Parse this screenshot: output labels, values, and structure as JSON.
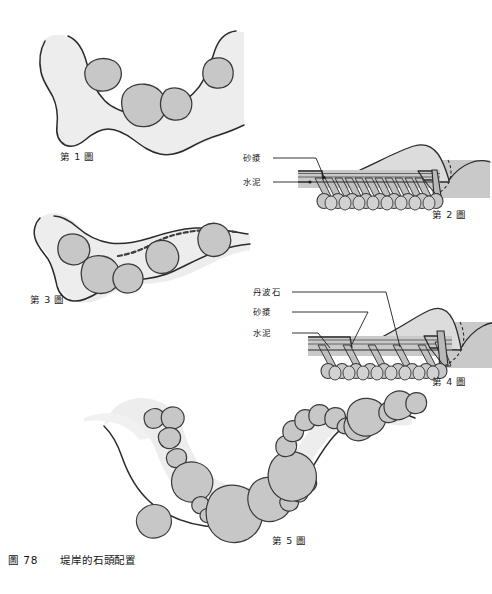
{
  "plate": {
    "caption_number": "圖 78",
    "caption_title": "堤岸的石頭配置",
    "background_color": "#ffffff",
    "ink_color": "#1d1d1d"
  },
  "palette": {
    "bank_fill": "#ededed",
    "bank_fill_light": "#f2f2f2",
    "stone_fill": "#c7c7c7",
    "stone_stroke": "#3a3a3a",
    "ground_fill": "#c9c9c9",
    "mound_fill": "#dcdcdc",
    "hatch_stroke": "#555555",
    "leader_stroke": "#1d1d1d"
  },
  "figures": [
    {
      "id": "fig1",
      "label": "第 1 圖",
      "type": "plan-view-bank",
      "description": "平面圖：堤岸曲線與岸邊配置的大小石頭",
      "stone_count": 4
    },
    {
      "id": "fig2",
      "label": "第 2 圖",
      "type": "cross-section",
      "description": "剖面圖：砂漿與水泥鋪設的堤岸斷面",
      "annotations": [
        {
          "key": "mortar",
          "label": "砂漿"
        },
        {
          "key": "cement",
          "label": "水泥"
        }
      ]
    },
    {
      "id": "fig3",
      "label": "第 3 圖",
      "type": "plan-view-bank",
      "description": "平面圖：較淺的堤岸與沿岸石頭配置",
      "stone_count": 5
    },
    {
      "id": "fig4",
      "label": "第 4 圖",
      "type": "cross-section",
      "description": "剖面圖：丹波石、砂漿與水泥鋪設的堤岸斷面",
      "annotations": [
        {
          "key": "tanba-stone",
          "label": "丹波石"
        },
        {
          "key": "mortar",
          "label": "砂漿"
        },
        {
          "key": "cement",
          "label": "水泥"
        }
      ]
    },
    {
      "id": "fig5",
      "label": "第 5 圖",
      "type": "plan-view-bank",
      "description": "平面圖：大量石頭沿著彎曲堤岸密集配置",
      "stone_count": 24
    }
  ]
}
